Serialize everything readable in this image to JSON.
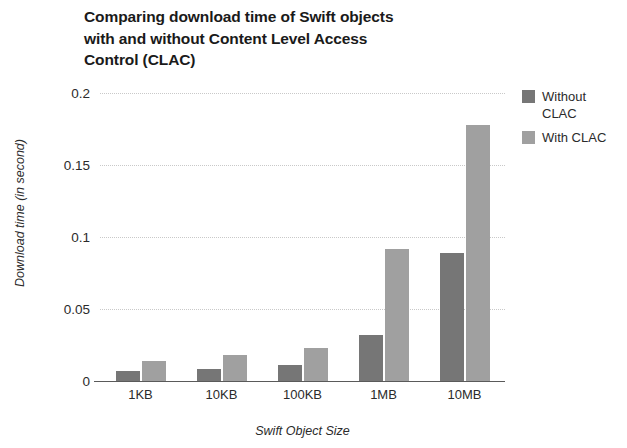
{
  "chart_data": {
    "type": "bar",
    "title": "Comparing download time of Swift objects with and without Content Level Access Control (CLAC)",
    "title_lines": [
      "Comparing download time of Swift objects",
      "with and without Content Level Access",
      "Control (CLAC)"
    ],
    "xlabel": "Swift Object Size",
    "ylabel": "Download time (in second)",
    "categories": [
      "1KB",
      "10KB",
      "100KB",
      "1MB",
      "10MB"
    ],
    "series": [
      {
        "name": "Without CLAC",
        "color": "#767676",
        "values": [
          0.007,
          0.008,
          0.011,
          0.032,
          0.089
        ]
      },
      {
        "name": "With CLAC",
        "color": "#a0a0a0",
        "values": [
          0.014,
          0.018,
          0.023,
          0.092,
          0.178
        ]
      }
    ],
    "ylim": [
      0,
      0.2
    ],
    "yticks": [
      0,
      0.05,
      0.1,
      0.15,
      0.2
    ],
    "ytick_labels": [
      "0",
      "0.05",
      "0.1",
      "0.15",
      "0.2"
    ],
    "grid": true,
    "grid_axis": "y",
    "grid_style": "dotted",
    "grid_color": "#c9c9c9",
    "legend_position": "right-top",
    "legend_entries": [
      "Without CLAC",
      "With CLAC"
    ],
    "legend_entry_lines": [
      [
        "Without",
        "CLAC"
      ],
      [
        "With CLAC"
      ]
    ],
    "background": "#ffffff",
    "axis_color": "#5a5a5a"
  }
}
